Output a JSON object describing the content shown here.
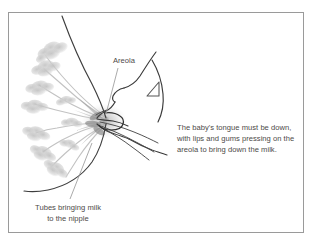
{
  "figure": {
    "title_alt": "Breastfeeding latch cross-section diagram",
    "frame": {
      "border_color": "#9a9a9a",
      "background": "#ffffff"
    },
    "labels": {
      "areola": "Areola",
      "tubes": "Tubes bringing milk\nto the nipple",
      "body_text": "The baby's tongue must be down,\nwith lips and gums pressing on the\nareola to bring down the milk."
    },
    "colors": {
      "text": "#4d4a48",
      "outline_dark": "#3a3a3a",
      "outline_mid": "#6f6f6f",
      "lobule_gray": "#c9c9c9",
      "duct_gray": "#bdbdbd",
      "leader_line": "#9b9b9b",
      "nipple_shadow": "#a8a8a8"
    },
    "markers": {
      "arrow_triangle": "triangle-marker"
    }
  }
}
